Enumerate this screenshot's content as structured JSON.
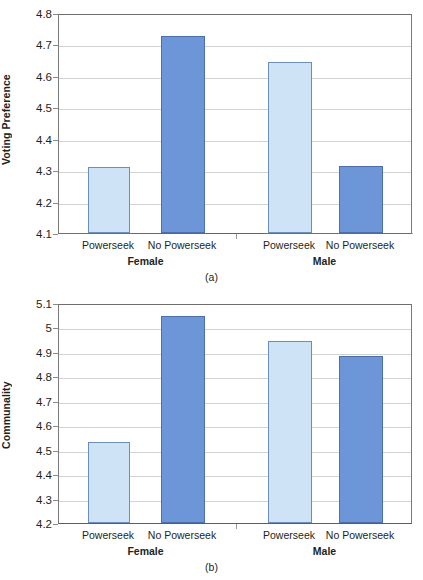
{
  "figure": {
    "background": "#ffffff",
    "colors": {
      "light_bar_fill": "#cfe3f6",
      "light_bar_stroke": "#6a8fbe",
      "dark_bar_fill": "#6d96d8",
      "dark_bar_stroke": "#4a6fae",
      "gridline": "#d2d2d2",
      "axis": "#7a7a7a",
      "text": "#231f20"
    }
  },
  "panels": [
    {
      "id": "a",
      "caption": "(a)",
      "ylabel": "Voting Preference",
      "yticks": [
        "4.1",
        "4.2",
        "4.3",
        "4.4",
        "4.5",
        "4.6",
        "4.7",
        "4.8"
      ],
      "groups": [
        "Female",
        "Male"
      ],
      "bars": [
        {
          "label": "Powerseek",
          "group": "Female",
          "value": 4.31,
          "style": "light"
        },
        {
          "label": "No Powerseek",
          "group": "Female",
          "value": 4.727,
          "style": "dark"
        },
        {
          "label": "Powerseek",
          "group": "Male",
          "value": 4.643,
          "style": "light"
        },
        {
          "label": "No Powerseek",
          "group": "Male",
          "value": 4.313,
          "style": "dark"
        }
      ]
    },
    {
      "id": "b",
      "caption": "(b)",
      "ylabel": "Communality",
      "yticks": [
        "4.2",
        "4.3",
        "4.4",
        "4.5",
        "4.6",
        "4.7",
        "4.8",
        "4.9",
        "5",
        "5.1"
      ],
      "groups": [
        "Female",
        "Male"
      ],
      "bars": [
        {
          "label": "Powerseek",
          "group": "Female",
          "value": 4.53,
          "style": "light"
        },
        {
          "label": "No Powerseek",
          "group": "Female",
          "value": 5.046,
          "style": "dark"
        },
        {
          "label": "Powerseek",
          "group": "Male",
          "value": 4.943,
          "style": "light"
        },
        {
          "label": "No Powerseek",
          "group": "Male",
          "value": 4.884,
          "style": "dark"
        }
      ]
    }
  ],
  "chart_data": [
    {
      "type": "bar",
      "title": "(a)",
      "xlabel": "",
      "ylabel": "Voting Preference",
      "ylim": [
        4.1,
        4.8
      ],
      "ytick_values": [
        4.1,
        4.2,
        4.3,
        4.4,
        4.5,
        4.6,
        4.7,
        4.8
      ],
      "grid": true,
      "legend": "none",
      "categories": [
        "Female / Powerseek",
        "Female / No Powerseek",
        "Male / Powerseek",
        "Male / No Powerseek"
      ],
      "values": [
        4.31,
        4.727,
        4.643,
        4.313
      ],
      "group_labels": [
        "Female",
        "Male"
      ],
      "condition_labels": [
        "Powerseek",
        "No Powerseek"
      ],
      "series": [
        {
          "name": "Powerseek",
          "values": [
            4.31,
            4.643
          ]
        },
        {
          "name": "No Powerseek",
          "values": [
            4.727,
            4.313
          ]
        }
      ]
    },
    {
      "type": "bar",
      "title": "(b)",
      "xlabel": "",
      "ylabel": "Communality",
      "ylim": [
        4.2,
        5.1
      ],
      "ytick_values": [
        4.2,
        4.3,
        4.4,
        4.5,
        4.6,
        4.7,
        4.8,
        4.9,
        5.0,
        5.1
      ],
      "grid": true,
      "legend": "none",
      "categories": [
        "Female / Powerseek",
        "Female / No Powerseek",
        "Male / Powerseek",
        "Male / No Powerseek"
      ],
      "values": [
        4.53,
        5.046,
        4.943,
        4.884
      ],
      "group_labels": [
        "Female",
        "Male"
      ],
      "condition_labels": [
        "Powerseek",
        "No Powerseek"
      ],
      "series": [
        {
          "name": "Powerseek",
          "values": [
            4.53,
            4.943
          ]
        },
        {
          "name": "No Powerseek",
          "values": [
            5.046,
            4.884
          ]
        }
      ]
    }
  ]
}
